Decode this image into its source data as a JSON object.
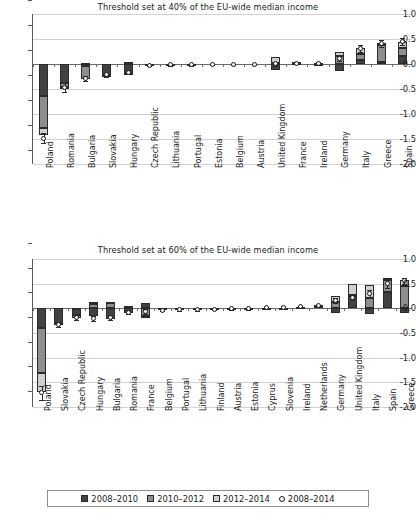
{
  "figure": {
    "legend": {
      "items": [
        {
          "label": "2008–2010",
          "kind": "bar",
          "color": "#414141"
        },
        {
          "label": "2010–2012",
          "kind": "bar",
          "color": "#8e8e8e"
        },
        {
          "label": "2012–2014",
          "kind": "bar",
          "color": "#cfcfcf"
        },
        {
          "label": "2008–2014",
          "kind": "marker",
          "color": "#ffffff"
        }
      ]
    }
  },
  "chart_data": [
    {
      "type": "bar",
      "title": "Threshold set at 40% of the EU-wide median income",
      "xlabel": "",
      "ylabel": "",
      "ylim": [
        -2.0,
        1.0
      ],
      "yticks": [
        1.0,
        0.5,
        0.0,
        -0.5,
        -1.0,
        -1.5,
        -2.0
      ],
      "ytick_labels": [
        "1.0",
        "0.5",
        "0.0",
        "-0.5",
        "-1.0",
        "-1.5",
        "-2.0"
      ],
      "grid": true,
      "stacked": true,
      "legend_position": "bottom-shared",
      "categories": [
        "Poland",
        "Romania",
        "Bulgaria",
        "Slovakia",
        "Hungary",
        "Czech Republic",
        "Lithuania",
        "Portugal",
        "Estonia",
        "Belgium",
        "Austria",
        "United Kingdom",
        "France",
        "Ireland",
        "Germany",
        "Italy",
        "Greece",
        "Spain"
      ],
      "series": [
        {
          "name": "2008–2010",
          "values": [
            -0.63,
            -0.38,
            -0.04,
            -0.22,
            -0.17,
            -0.02,
            -0.01,
            -0.01,
            0.0,
            0.0,
            0.0,
            -0.12,
            0.02,
            0.01,
            -0.14,
            0.09,
            0.04,
            0.17
          ]
        },
        {
          "name": "2010–2012",
          "values": [
            -0.65,
            -0.08,
            -0.25,
            -0.01,
            -0.02,
            0.0,
            0.0,
            0.0,
            0.0,
            0.0,
            0.0,
            0.02,
            0.01,
            0.01,
            0.16,
            0.12,
            0.34,
            0.16
          ]
        },
        {
          "name": "2012–2014",
          "values": [
            -0.14,
            -0.02,
            0.03,
            0.0,
            0.05,
            0.0,
            0.01,
            0.0,
            0.0,
            0.0,
            0.0,
            0.12,
            0.01,
            0.0,
            0.08,
            0.12,
            0.05,
            0.11
          ]
        }
      ],
      "overall": {
        "name": "2008–2014",
        "values": [
          -1.48,
          -0.46,
          -0.28,
          -0.21,
          -0.16,
          -0.02,
          -0.01,
          -0.01,
          0.0,
          0.0,
          0.0,
          0.01,
          0.02,
          0.02,
          0.11,
          0.31,
          0.42,
          0.45
        ],
        "err": [
          0.1,
          0.09,
          0.05,
          0.04,
          0.04,
          0.02,
          0.02,
          0.02,
          0.01,
          0.01,
          0.01,
          0.04,
          0.02,
          0.02,
          0.05,
          0.07,
          0.07,
          0.07
        ]
      }
    },
    {
      "type": "bar",
      "title": "Threshold set at 60% of the EU-wide median income",
      "xlabel": "",
      "ylabel": "",
      "ylim": [
        -2.0,
        1.0
      ],
      "yticks": [
        1.0,
        0.5,
        0.0,
        -0.5,
        -1.0,
        -1.5,
        -2.0
      ],
      "ytick_labels": [
        "1.0",
        "0.5",
        "0.0",
        "-0.5",
        "-1.0",
        "-1.5",
        "-2.0"
      ],
      "grid": true,
      "stacked": true,
      "legend_position": "bottom-shared",
      "categories": [
        "Poland",
        "Slovakia",
        "Czech Republic",
        "Hungary",
        "Bulgaria",
        "Romania",
        "France",
        "Belgium",
        "Portugal",
        "Lithuania",
        "Finland",
        "Austria",
        "Estonia",
        "Cyprus",
        "Slovenia",
        "Ireland",
        "Netherlands",
        "Germany",
        "United Kingdom",
        "Italy",
        "Spain",
        "Greece"
      ],
      "series": [
        {
          "name": "2008–2010",
          "values": [
            -0.39,
            -0.3,
            -0.13,
            -0.15,
            -0.21,
            -0.1,
            0.11,
            -0.04,
            -0.03,
            -0.02,
            -0.01,
            -0.01,
            -0.01,
            0.01,
            0.01,
            0.03,
            0.05,
            -0.1,
            0.22,
            -0.12,
            0.33,
            -0.1
          ]
        },
        {
          "name": "2010–2012",
          "values": [
            -0.93,
            -0.04,
            -0.06,
            0.09,
            0.11,
            0.03,
            -0.15,
            0.01,
            0.01,
            0.01,
            0.0,
            0.0,
            0.0,
            0.0,
            0.0,
            0.0,
            0.01,
            0.12,
            0.05,
            0.21,
            0.25,
            0.46
          ]
        },
        {
          "name": "2012–2014",
          "values": [
            -0.38,
            0.0,
            0.01,
            0.03,
            0.02,
            0.02,
            -0.03,
            0.0,
            0.0,
            0.0,
            0.0,
            0.0,
            0.0,
            0.0,
            0.0,
            0.0,
            0.01,
            0.13,
            0.22,
            0.26,
            0.03,
            0.12
          ]
        }
      ],
      "overall": {
        "name": "2008–2014",
        "values": [
          -1.71,
          -0.33,
          -0.18,
          -0.21,
          -0.19,
          -0.08,
          -0.07,
          -0.04,
          -0.03,
          -0.03,
          -0.02,
          -0.01,
          -0.01,
          0.01,
          0.02,
          0.03,
          0.05,
          0.15,
          0.22,
          0.3,
          0.51,
          0.56
        ],
        "err": [
          0.14,
          0.05,
          0.05,
          0.05,
          0.05,
          0.04,
          0.05,
          0.02,
          0.02,
          0.02,
          0.02,
          0.02,
          0.02,
          0.02,
          0.02,
          0.02,
          0.02,
          0.05,
          0.06,
          0.07,
          0.09,
          0.06
        ]
      }
    }
  ]
}
